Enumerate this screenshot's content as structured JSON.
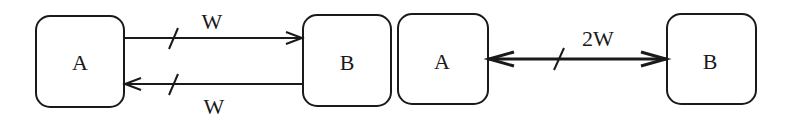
{
  "diagram": {
    "left": {
      "node_a": {
        "label": "A"
      },
      "node_b": {
        "label": "B"
      },
      "forward_edge": {
        "label": "W",
        "direction": "A-to-B"
      },
      "backward_edge": {
        "label": "W",
        "direction": "B-to-A"
      }
    },
    "right": {
      "node_a": {
        "label": "A"
      },
      "node_b": {
        "label": "B"
      },
      "bidirectional_edge": {
        "label": "2W",
        "direction": "bidirectional"
      }
    }
  }
}
